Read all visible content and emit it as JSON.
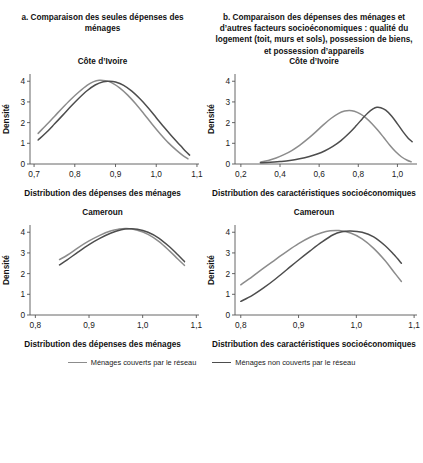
{
  "figure": {
    "panel_a_title": "a. Comparaison des seules dépenses des ménages",
    "panel_b_title": "b. Comparaison des dépenses des ménages et d’autres facteurs socioéconomiques : qualité du logement (toit, murs et sols), possession de biens, et possession d’appareils"
  },
  "legend": {
    "items": [
      {
        "label": "Ménages couverts par le réseau",
        "color": "#8c8c8c"
      },
      {
        "label": "Ménages non couverts par le réseau",
        "color": "#4d4d4d"
      }
    ]
  },
  "colors": {
    "covered": "#8c8c8c",
    "not_covered": "#4d4d4d",
    "axis": "#555555",
    "text": "#1a1a1a"
  },
  "chart_data": [
    {
      "id": "cote-divoire-depenses",
      "type": "line",
      "title": "Côte d’Ivoire",
      "panel": "a",
      "xlabel": "Distribution des dépenses des ménages",
      "ylabel": "Densité",
      "xlim": [
        0.69,
        1.105
      ],
      "ylim": [
        0,
        4.35
      ],
      "xticks": [
        0.7,
        0.8,
        0.9,
        1.0,
        1.1
      ],
      "xticklabels": [
        "0,7",
        "0,8",
        "0,9",
        "1,0",
        "1,1"
      ],
      "yticks": [
        0,
        1,
        2,
        3,
        4
      ],
      "yticklabels": [
        "0",
        "1",
        "2",
        "3",
        "4"
      ],
      "grid": false,
      "series": [
        {
          "name": "Ménages couverts par le réseau",
          "color": "#8c8c8c",
          "x": [
            0.71,
            0.73,
            0.75,
            0.77,
            0.79,
            0.81,
            0.83,
            0.845,
            0.86,
            0.875,
            0.89,
            0.91,
            0.93,
            0.95,
            0.97,
            0.99,
            1.01,
            1.03,
            1.05,
            1.065,
            1.078
          ],
          "y": [
            1.48,
            1.88,
            2.3,
            2.72,
            3.12,
            3.48,
            3.8,
            3.97,
            4.05,
            4.03,
            3.93,
            3.68,
            3.33,
            2.9,
            2.42,
            1.92,
            1.45,
            1.02,
            0.66,
            0.42,
            0.25
          ]
        },
        {
          "name": "Ménages non couverts par le réseau",
          "color": "#4d4d4d",
          "x": [
            0.71,
            0.73,
            0.75,
            0.77,
            0.79,
            0.81,
            0.83,
            0.85,
            0.87,
            0.885,
            0.9,
            0.92,
            0.94,
            0.96,
            0.98,
            1.0,
            1.02,
            1.04,
            1.06,
            1.072,
            1.082
          ],
          "y": [
            1.16,
            1.52,
            1.93,
            2.35,
            2.78,
            3.18,
            3.54,
            3.82,
            3.98,
            4.0,
            3.96,
            3.8,
            3.52,
            3.15,
            2.72,
            2.24,
            1.76,
            1.3,
            0.88,
            0.62,
            0.43
          ]
        }
      ]
    },
    {
      "id": "cote-divoire-caracteristiques",
      "type": "line",
      "title": "Côte d’Ivoire",
      "panel": "b",
      "xlabel": "Distribution des caractéristiques socioéconomiques",
      "ylabel": "Densité",
      "xlim": [
        0.17,
        1.1
      ],
      "ylim": [
        0,
        4.35
      ],
      "xticks": [
        0.2,
        0.4,
        0.6,
        0.8,
        1.0
      ],
      "xticklabels": [
        "0,2",
        "0,4",
        "0,6",
        "0,8",
        "1,0"
      ],
      "yticks": [
        0,
        1,
        2,
        3,
        4
      ],
      "yticklabels": [
        "0",
        "1",
        "2",
        "3",
        "4"
      ],
      "grid": false,
      "series": [
        {
          "name": "Ménages couverts par le réseau",
          "color": "#8c8c8c",
          "x": [
            0.3,
            0.34,
            0.38,
            0.42,
            0.46,
            0.5,
            0.54,
            0.58,
            0.62,
            0.66,
            0.7,
            0.73,
            0.755,
            0.78,
            0.81,
            0.84,
            0.87,
            0.9,
            0.93,
            0.96,
            0.99,
            1.02,
            1.05,
            1.07
          ],
          "y": [
            0.09,
            0.17,
            0.29,
            0.45,
            0.65,
            0.9,
            1.2,
            1.53,
            1.88,
            2.2,
            2.45,
            2.56,
            2.59,
            2.55,
            2.42,
            2.22,
            1.95,
            1.63,
            1.28,
            0.92,
            0.6,
            0.35,
            0.18,
            0.11
          ]
        },
        {
          "name": "Ménages non couverts par le réseau",
          "color": "#4d4d4d",
          "x": [
            0.3,
            0.35,
            0.4,
            0.45,
            0.5,
            0.55,
            0.59,
            0.63,
            0.67,
            0.71,
            0.75,
            0.79,
            0.82,
            0.85,
            0.875,
            0.895,
            0.915,
            0.94,
            0.97,
            1.0,
            1.03,
            1.055,
            1.075
          ],
          "y": [
            0.06,
            0.08,
            0.12,
            0.17,
            0.25,
            0.36,
            0.48,
            0.64,
            0.85,
            1.12,
            1.46,
            1.86,
            2.18,
            2.48,
            2.66,
            2.74,
            2.72,
            2.6,
            2.32,
            1.94,
            1.54,
            1.25,
            1.08
          ]
        }
      ]
    },
    {
      "id": "cameroun-depenses",
      "type": "line",
      "title": "Cameroun",
      "panel": "a",
      "xlabel": "Distribution des dépenses des ménages",
      "ylabel": "Densité",
      "xlim": [
        0.79,
        1.105
      ],
      "ylim": [
        0,
        4.35
      ],
      "xticks": [
        0.8,
        0.9,
        1.0,
        1.1
      ],
      "xticklabels": [
        "0,8",
        "0,9",
        "1,0",
        "1,1"
      ],
      "yticks": [
        0,
        1,
        2,
        3,
        4
      ],
      "yticklabels": [
        "0",
        "1",
        "2",
        "3",
        "4"
      ],
      "grid": false,
      "series": [
        {
          "name": "Ménages couverts par le réseau",
          "color": "#8c8c8c",
          "x": [
            0.845,
            0.86,
            0.88,
            0.9,
            0.92,
            0.94,
            0.955,
            0.97,
            0.99,
            1.01,
            1.03,
            1.05,
            1.065,
            1.078
          ],
          "y": [
            2.68,
            2.9,
            3.26,
            3.58,
            3.85,
            4.06,
            4.15,
            4.18,
            4.1,
            3.9,
            3.56,
            3.1,
            2.72,
            2.4
          ]
        },
        {
          "name": "Ménages non couverts par le réseau",
          "color": "#4d4d4d",
          "x": [
            0.845,
            0.86,
            0.88,
            0.9,
            0.92,
            0.94,
            0.96,
            0.975,
            0.99,
            1.01,
            1.03,
            1.05,
            1.065,
            1.078
          ],
          "y": [
            2.42,
            2.68,
            3.05,
            3.4,
            3.7,
            3.95,
            4.12,
            4.17,
            4.15,
            4.0,
            3.72,
            3.3,
            2.92,
            2.58
          ]
        }
      ]
    },
    {
      "id": "cameroun-caracteristiques",
      "type": "line",
      "title": "Cameroun",
      "panel": "b",
      "xlabel": "Distribution des caractéristiques socioéconomiques",
      "ylabel": "Densité",
      "xlim": [
        0.79,
        1.105
      ],
      "ylim": [
        0,
        4.35
      ],
      "xticks": [
        0.8,
        0.9,
        1.0,
        1.1
      ],
      "xticklabels": [
        "0,8",
        "0,9",
        "1,0",
        "1,1"
      ],
      "yticks": [
        0,
        1,
        2,
        3,
        4
      ],
      "yticklabels": [
        "0",
        "1",
        "2",
        "3",
        "4"
      ],
      "grid": false,
      "series": [
        {
          "name": "Ménages couverts par le réseau",
          "color": "#8c8c8c",
          "x": [
            0.8,
            0.82,
            0.84,
            0.86,
            0.88,
            0.9,
            0.92,
            0.94,
            0.955,
            0.97,
            0.99,
            1.01,
            1.03,
            1.05,
            1.065,
            1.078
          ],
          "y": [
            1.46,
            1.86,
            2.28,
            2.68,
            3.08,
            3.45,
            3.76,
            3.98,
            4.07,
            4.08,
            3.96,
            3.68,
            3.22,
            2.62,
            2.08,
            1.62
          ]
        },
        {
          "name": "Ménages non couverts par le réseau",
          "color": "#4d4d4d",
          "x": [
            0.8,
            0.82,
            0.84,
            0.86,
            0.88,
            0.9,
            0.92,
            0.94,
            0.96,
            0.975,
            0.99,
            1.01,
            1.03,
            1.05,
            1.065,
            1.078
          ],
          "y": [
            0.66,
            0.95,
            1.32,
            1.74,
            2.2,
            2.66,
            3.1,
            3.52,
            3.88,
            4.02,
            4.06,
            4.0,
            3.78,
            3.35,
            2.92,
            2.5
          ]
        }
      ]
    }
  ]
}
